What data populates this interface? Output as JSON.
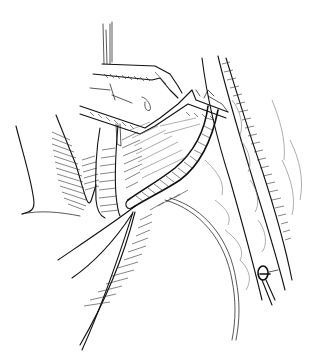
{
  "illustration": {
    "subject": "surgical line drawing",
    "style": "black ink hatching on white",
    "colors": {
      "background": "#ffffff",
      "ink": "#111111"
    },
    "elements": [
      "forceps-upper",
      "forceps-lower",
      "tubular-structure",
      "catheter-needle",
      "tissue-layers-right",
      "tissue-fold-left",
      "clip-marker"
    ]
  }
}
